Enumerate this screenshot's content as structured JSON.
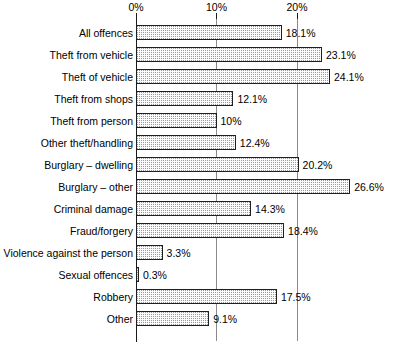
{
  "chart_data": {
    "type": "bar",
    "orientation": "horizontal",
    "title": "",
    "subtitle": "",
    "xlabel": "",
    "ylabel": "",
    "xlim": [
      0,
      30
    ],
    "grid": true,
    "legend": null,
    "axis": {
      "ticks": [
        {
          "value": 0,
          "label": "0%"
        },
        {
          "value": 10,
          "label": "10%"
        },
        {
          "value": 20,
          "label": "20%"
        }
      ],
      "tick_label_suffix": "%"
    },
    "categories": [
      "All offences",
      "Theft from vehicle",
      "Theft of vehicle",
      "Theft from shops",
      "Theft from person",
      "Other theft/handling",
      "Burglary – dwelling",
      "Burglary – other",
      "Criminal damage",
      "Fraud/forgery",
      "Violence against the person",
      "Sexual offences",
      "Robbery",
      "Other"
    ],
    "values": [
      18.1,
      23.1,
      24.1,
      12.1,
      10,
      12.4,
      20.2,
      26.6,
      14.3,
      18.4,
      3.3,
      0.3,
      17.5,
      9.1
    ],
    "value_labels": [
      "18.1%",
      "23.1%",
      "24.1%",
      "12.1%",
      "10%",
      "12.4%",
      "20.2%",
      "26.6%",
      "14.3%",
      "18.4%",
      "3.3%",
      "0.3%",
      "17.5%",
      "9.1%"
    ],
    "colors": {
      "bar_fill": "#fbfbfb",
      "bar_pattern": "#9a9a9a",
      "bar_border": "#1f1f1f",
      "axis": "#1a1a1a",
      "gridline": "#8a8a8a",
      "text": "#000000",
      "background": "#ffffff"
    }
  }
}
